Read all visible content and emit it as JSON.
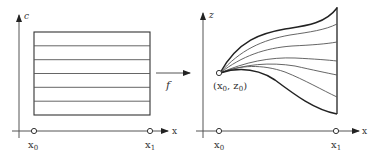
{
  "left_panel": {
    "y_axis_label": "c",
    "x_axis_label": "x",
    "x0_label": "x",
    "x0_sub": "0",
    "x1_label": "x",
    "x1_sub": "1",
    "band_count": 6
  },
  "mapping": {
    "label": "f"
  },
  "right_panel": {
    "y_axis_label": "z",
    "x_axis_label": "x",
    "x0_label": "x",
    "x0_sub": "0",
    "x1_label": "x",
    "x1_sub": "1",
    "point_label": "(x",
    "point_label_sub1": "0",
    "point_label_mid": ", z",
    "point_label_sub2": "0",
    "point_label_end": ")",
    "curve_count": 7
  },
  "colors": {
    "line": "#444444",
    "thick_line": "#222222",
    "thin_line": "#555555"
  }
}
